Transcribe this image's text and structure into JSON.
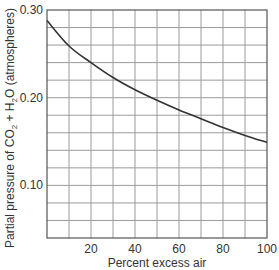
{
  "chart_data": {
    "type": "line",
    "title": "",
    "xlabel": "Percent excess air",
    "ylabel_parts": [
      "Partial pressure of CO",
      "2",
      " + H",
      "2",
      "O (atmospheres)"
    ],
    "ylabel": "Partial pressure of CO2 + H2O (atmospheres)",
    "xlim": [
      0,
      100
    ],
    "ylim": [
      0.04,
      0.3
    ],
    "x_ticks": [
      20,
      40,
      60,
      80,
      100
    ],
    "x_tick_labels": [
      "20",
      "40",
      "60",
      "80",
      "100"
    ],
    "y_ticks": [
      0.1,
      0.2,
      0.3
    ],
    "y_tick_labels": [
      "0.10",
      "0.20",
      "0.30"
    ],
    "x_grid_step": 10,
    "y_grid_step": 0.02,
    "grid": true,
    "legend": null,
    "series": [
      {
        "name": "Partial pressure of CO2 + H2O",
        "x": [
          0,
          10,
          20,
          30,
          40,
          50,
          60,
          70,
          80,
          90,
          100
        ],
        "values": [
          0.288,
          0.259,
          0.24,
          0.223,
          0.209,
          0.197,
          0.186,
          0.176,
          0.166,
          0.157,
          0.149
        ]
      }
    ]
  }
}
